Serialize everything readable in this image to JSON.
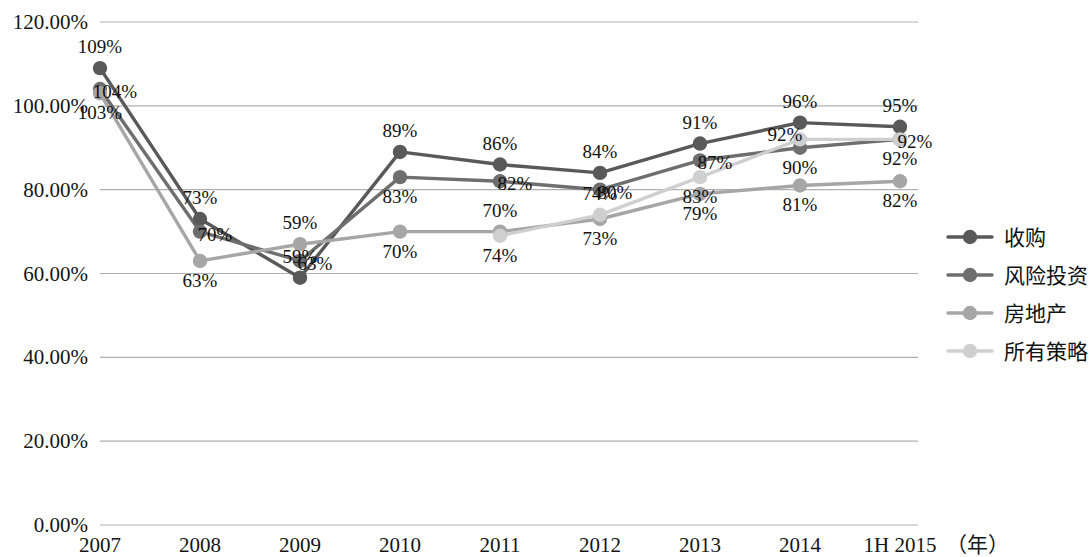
{
  "chart_data": {
    "type": "line",
    "title": "",
    "subtitle": "",
    "xlabel": "（年）",
    "ylabel": "",
    "grid": true,
    "legend_position": "right",
    "ylim": [
      0,
      120
    ],
    "ytick_labels": [
      "0.00%",
      "20.00%",
      "40.00%",
      "60.00%",
      "80.00%",
      "100.00%",
      "120.00%"
    ],
    "ytick_values": [
      0,
      20,
      40,
      60,
      80,
      100,
      120
    ],
    "categories": [
      "2007",
      "2008",
      "2009",
      "2010",
      "2011",
      "2012",
      "2013",
      "2014",
      "1H 2015"
    ],
    "series": [
      {
        "name": "收购",
        "color": "#595959",
        "values": [
          109,
          73,
          59,
          89,
          86,
          84,
          91,
          96,
          95
        ],
        "labels": [
          "109%",
          "73%",
          "59%",
          "89%",
          "86%",
          "84%",
          "91%",
          "96%",
          "95%"
        ],
        "label_pos": [
          "above",
          "above",
          "above",
          "above",
          "above",
          "above",
          "above",
          "above",
          "above"
        ]
      },
      {
        "name": "风险投资",
        "color": "#6e6e6e",
        "values": [
          104,
          70,
          63,
          83,
          82,
          80,
          87,
          90,
          92
        ],
        "labels": [
          "104%",
          "70%",
          "63%",
          "83%",
          "82%",
          "80%",
          "87%",
          "90%",
          "92%"
        ],
        "label_pos": [
          "right",
          "right",
          "right",
          "below",
          "right",
          "right",
          "right",
          "below",
          "below"
        ]
      },
      {
        "name": "房地产",
        "color": "#a6a6a6",
        "values": [
          103,
          63,
          67,
          70,
          70,
          73,
          79,
          81,
          82
        ],
        "labels": [
          "103%",
          "63%",
          "59%",
          "70%",
          "70%",
          "73%",
          "79%",
          "81%",
          "82%"
        ],
        "label_pos": [
          "below",
          "below",
          "above",
          "below",
          "above",
          "below",
          "below",
          "below",
          "below"
        ]
      },
      {
        "name": "所有策略",
        "color": "#cfcfcf",
        "values": [
          null,
          null,
          null,
          null,
          69,
          74,
          83,
          92,
          92
        ],
        "labels": [
          "",
          "",
          "",
          "",
          "74%",
          "74%",
          "83%",
          "92%",
          "92%"
        ],
        "label_pos": [
          "",
          "",
          "",
          "",
          "below",
          "above",
          "below",
          "left",
          "right"
        ]
      }
    ]
  },
  "legend": {
    "items": [
      {
        "label": "收购",
        "color": "#595959"
      },
      {
        "label": "风险投资",
        "color": "#6e6e6e"
      },
      {
        "label": "房地产",
        "color": "#a6a6a6"
      },
      {
        "label": "所有策略",
        "color": "#cfcfcf"
      }
    ]
  },
  "axis": {
    "x_unit": "（年）",
    "gridline_color": "#b0b0b0"
  }
}
